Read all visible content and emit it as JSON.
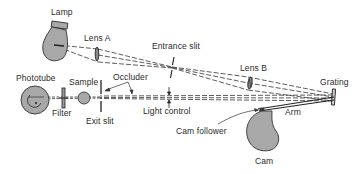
{
  "diagram": {
    "type": "optical-schematic",
    "colors": {
      "component_fill": "#a8a8a8",
      "stroke": "#333333",
      "background": "#ffffff"
    },
    "labels": {
      "lamp": "Lamp",
      "lens_a": "Lens A",
      "entrance_slit": "Entrance slit",
      "lens_b": "Lens B",
      "grating": "Grating",
      "phototube": "Phototube",
      "sample": "Sample",
      "occluder": "Occluder",
      "filter": "Filter",
      "exit_slit": "Exit slit",
      "light_control": "Light control",
      "arm": "Arm",
      "cam_follower": "Cam follower",
      "cam": "Cam"
    },
    "components": [
      {
        "id": "lamp",
        "icon": "lamp-bulb-icon"
      },
      {
        "id": "lens_a",
        "icon": "lens-icon"
      },
      {
        "id": "entrance_slit",
        "icon": "slit-icon"
      },
      {
        "id": "lens_b",
        "icon": "lens-icon"
      },
      {
        "id": "grating",
        "icon": "grating-icon"
      },
      {
        "id": "arm",
        "icon": "arm-lever-icon"
      },
      {
        "id": "cam",
        "icon": "cam-icon"
      },
      {
        "id": "cam_follower",
        "icon": "cam-follower-icon"
      },
      {
        "id": "light_control",
        "icon": "aperture-arrows-icon"
      },
      {
        "id": "occluder",
        "icon": "occluder-icon"
      },
      {
        "id": "exit_slit",
        "icon": "slit-icon"
      },
      {
        "id": "sample",
        "icon": "sample-cuvette-icon"
      },
      {
        "id": "filter",
        "icon": "filter-icon"
      },
      {
        "id": "phototube",
        "icon": "phototube-icon"
      }
    ]
  }
}
